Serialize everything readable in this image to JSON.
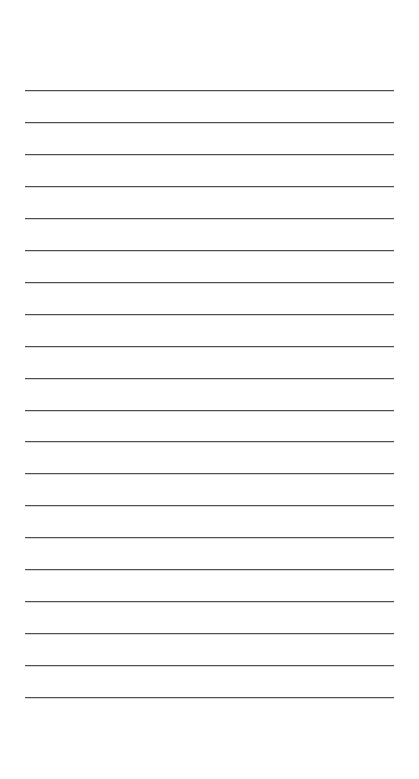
{
  "page": {
    "kind": "lined-paper-sheet",
    "width_px": 419,
    "height_px": 779,
    "background_color": "#ffffff",
    "text_content": "",
    "note": ""
  },
  "rules": {
    "label": "horizontal ruling lines",
    "count": 20,
    "color": "#4f4f4f",
    "thickness_px": 1,
    "left_px": 25,
    "right_px": 394,
    "length_px": 369,
    "first_line_y_px": 90,
    "last_line_y_px": 697,
    "spacing_px": 31.95,
    "top_margin_px": 90,
    "bottom_margin_px": 82,
    "left_margin_px": 25,
    "right_margin_px": 25,
    "lines": [
      {
        "index": 1,
        "y": 90
      },
      {
        "index": 2,
        "y": 122
      },
      {
        "index": 3,
        "y": 154
      },
      {
        "index": 4,
        "y": 186
      },
      {
        "index": 5,
        "y": 218
      },
      {
        "index": 6,
        "y": 250
      },
      {
        "index": 7,
        "y": 282
      },
      {
        "index": 8,
        "y": 314
      },
      {
        "index": 9,
        "y": 346
      },
      {
        "index": 10,
        "y": 378
      },
      {
        "index": 11,
        "y": 410
      },
      {
        "index": 12,
        "y": 441
      },
      {
        "index": 13,
        "y": 473
      },
      {
        "index": 14,
        "y": 505
      },
      {
        "index": 15,
        "y": 537
      },
      {
        "index": 16,
        "y": 569
      },
      {
        "index": 17,
        "y": 601
      },
      {
        "index": 18,
        "y": 633
      },
      {
        "index": 19,
        "y": 665
      },
      {
        "index": 20,
        "y": 697
      }
    ]
  }
}
